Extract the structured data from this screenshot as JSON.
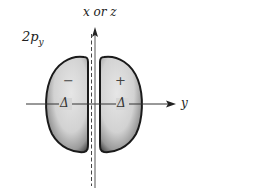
{
  "diagram": {
    "orbital_label": {
      "main": "2p",
      "subscript": "y"
    },
    "vertical_axis_label": "x or z",
    "horizontal_axis_label": "y",
    "lobes": [
      {
        "side": "left",
        "sign": "−",
        "node_marker": "Δ"
      },
      {
        "side": "right",
        "sign": "+",
        "node_marker": "Δ"
      }
    ],
    "colors": {
      "lobe_fill": "#d9d9d9",
      "lobe_shadow": "#2a2a2a",
      "axis": "#333333"
    }
  }
}
